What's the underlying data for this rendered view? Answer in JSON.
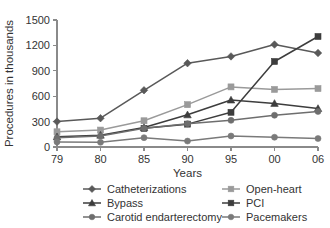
{
  "chart_data": {
    "type": "line",
    "title": "",
    "xlabel": "Years",
    "ylabel": "Procedures in thousands",
    "categories": [
      "79",
      "80",
      "85",
      "90",
      "95",
      "00",
      "06"
    ],
    "x_tick_labels": [
      "79",
      "80",
      "85",
      "90",
      "95",
      "00",
      "06"
    ],
    "y_tick_labels": [
      "0",
      "300",
      "600",
      "900",
      "1200",
      "1500"
    ],
    "y_ticks": [
      0,
      300,
      600,
      900,
      1200,
      1500
    ],
    "ylim": [
      0,
      1500
    ],
    "grid": false,
    "legend_position": "bottom",
    "legend_columns": 2,
    "series": [
      {
        "name": "Catheterizations",
        "marker": "diamond",
        "color": "#595959",
        "values": [
          300,
          340,
          670,
          990,
          1070,
          1210,
          1110
        ]
      },
      {
        "name": "Open-heart",
        "marker": "square",
        "color": "#9a9a9a",
        "values": [
          180,
          200,
          310,
          500,
          710,
          680,
          690
        ]
      },
      {
        "name": "Bypass",
        "marker": "triangle",
        "color": "#3d3d3d",
        "values": [
          120,
          140,
          230,
          380,
          555,
          515,
          455
        ]
      },
      {
        "name": "PCI",
        "marker": "square",
        "color": "#3d3d3d",
        "values": [
          0,
          0,
          220,
          270,
          410,
          1010,
          1305
        ]
      },
      {
        "name": "Carotid endarterectomy",
        "marker": "circle",
        "color": "#6e6e6e",
        "values": [
          110,
          130,
          220,
          275,
          315,
          375,
          420
        ]
      },
      {
        "name": "Pacemakers",
        "marker": "circle",
        "color": "#7a7a7a",
        "values": [
          60,
          55,
          110,
          70,
          130,
          115,
          100
        ]
      }
    ]
  },
  "legend": {
    "entries": [
      {
        "label": "Catheterizations"
      },
      {
        "label": "Open-heart"
      },
      {
        "label": "Bypass"
      },
      {
        "label": "PCI"
      },
      {
        "label": "Carotid endarterectomy"
      },
      {
        "label": "Pacemakers"
      }
    ]
  }
}
